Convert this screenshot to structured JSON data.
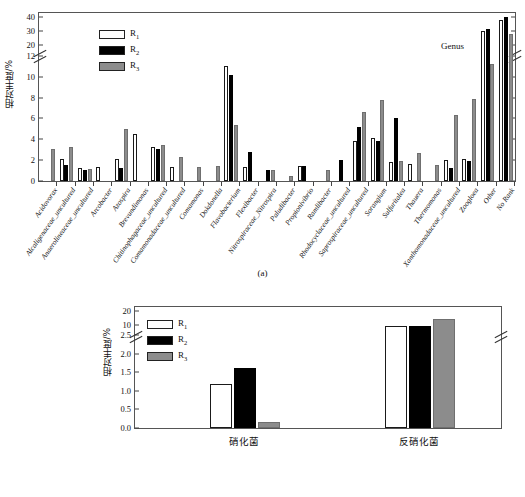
{
  "figure": {
    "panel_a_caption": "(a)",
    "panel_b_caption": "(b)"
  },
  "panel_a": {
    "annotation": "Genus",
    "ylabel": "相对丰度/%",
    "legend": [
      {
        "key": "R1",
        "label": "R",
        "sub": "1",
        "color": "#ffffff"
      },
      {
        "key": "R2",
        "label": "R",
        "sub": "2",
        "color": "#000000"
      },
      {
        "key": "R3",
        "label": "R",
        "sub": "3",
        "color": "#8c8c8c"
      }
    ],
    "y_ticks_lower": [
      0,
      2,
      4,
      6,
      8,
      10,
      12
    ],
    "y_ticks_upper": [
      20,
      30,
      40
    ],
    "axis_break": true
  },
  "panel_b": {
    "ylabel": "相对丰度/%",
    "legend": [
      {
        "key": "R1",
        "label": "R",
        "sub": "1",
        "color": "#ffffff"
      },
      {
        "key": "R2",
        "label": "R",
        "sub": "2",
        "color": "#000000"
      },
      {
        "key": "R3",
        "label": "R",
        "sub": "3",
        "color": "#8c8c8c"
      }
    ],
    "y_ticks_lower": [
      0.0,
      0.5,
      1.0,
      1.5,
      2.0,
      2.5
    ],
    "y_ticks_upper": [
      10,
      20
    ],
    "axis_break": true
  },
  "chart_data": [
    {
      "type": "bar",
      "id": "panel-a",
      "title": "",
      "annotation": "Genus",
      "xlabel": "",
      "ylabel": "相对丰度/%",
      "ylim": [
        0,
        40
      ],
      "y_axis_break": {
        "lower": [
          0,
          12
        ],
        "upper": [
          12,
          40
        ],
        "upper_ticks": [
          20,
          30,
          40
        ],
        "lower_ticks": [
          0,
          2,
          4,
          6,
          8,
          10,
          12
        ]
      },
      "grid": false,
      "legend": [
        "R1",
        "R2",
        "R3"
      ],
      "legend_position": "upper-left",
      "categories": [
        "Acidovorax",
        "Alcaligenaceae_uncultured",
        "Anaerolineaceae_uncultured",
        "Arcobacter",
        "Azospira",
        "Brevundimonas",
        "Chitinophagaceae_uncultured",
        "Comamonadaceae_uncultured",
        "Comamonas",
        "Dokdonella",
        "Flavobacterium",
        "Flexibacter",
        "Nitrospiraceae_Nitrospira",
        "Paludibacter",
        "Propionivibrio",
        "Ramlibacter",
        "Rhodocyclaceae_uncultured",
        "Saprospiraceae_uncultured",
        "Sorangium",
        "Sulfuritalea",
        "Thauera",
        "Thermomonas",
        "Xanthomonadaceae_uncultured",
        "Zoogloea",
        "Other",
        "No Rank"
      ],
      "series": [
        {
          "name": "R1",
          "color": "#ffffff",
          "values": [
            0,
            2.1,
            1.2,
            1.35,
            2.15,
            4.5,
            3.25,
            1.3,
            0,
            0,
            11.0,
            1.3,
            0,
            0,
            1.45,
            0,
            0,
            3.8,
            4.15,
            1.85,
            1.6,
            0,
            2.0,
            2.15,
            30.0,
            37.5
          ]
        },
        {
          "name": "R2",
          "color": "#000000",
          "values": [
            0,
            1.5,
            1.1,
            0,
            1.25,
            0,
            3.1,
            0,
            0,
            0,
            10.15,
            2.8,
            1.05,
            0,
            1.45,
            0,
            2.0,
            5.2,
            3.85,
            6.0,
            0,
            0,
            1.2,
            1.95,
            31.0,
            39.8
          ]
        },
        {
          "name": "R3",
          "color": "#8c8c8c",
          "values": [
            3.05,
            3.25,
            1.15,
            0,
            5.0,
            0,
            3.5,
            2.3,
            1.35,
            1.45,
            5.35,
            0,
            1.1,
            0.5,
            0,
            1.1,
            0,
            6.6,
            7.75,
            1.95,
            2.7,
            1.55,
            6.35,
            7.9,
            11.2,
            27.5
          ]
        }
      ]
    },
    {
      "type": "bar",
      "id": "panel-b",
      "title": "",
      "xlabel": "",
      "ylabel": "相对丰度/%",
      "ylim": [
        0,
        20
      ],
      "y_axis_break": {
        "lower": [
          0,
          2.5
        ],
        "upper": [
          2.5,
          20
        ],
        "upper_ticks": [
          10,
          20
        ],
        "lower_ticks": [
          0.0,
          0.5,
          1.0,
          1.5,
          2.0,
          2.5
        ]
      },
      "grid": false,
      "legend": [
        "R1",
        "R2",
        "R3"
      ],
      "legend_position": "upper-left",
      "categories": [
        "硝化菌",
        "反硝化菌"
      ],
      "series": [
        {
          "name": "R1",
          "color": "#ffffff",
          "values": [
            1.2,
            9.5
          ]
        },
        {
          "name": "R2",
          "color": "#000000",
          "values": [
            1.63,
            9.0
          ]
        },
        {
          "name": "R3",
          "color": "#8c8c8c",
          "values": [
            0.15,
            14.0
          ]
        }
      ]
    }
  ]
}
